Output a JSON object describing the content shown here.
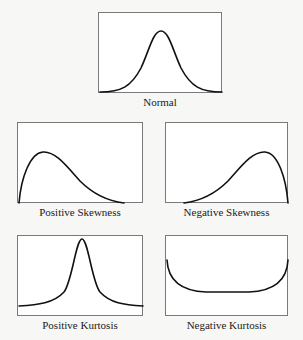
{
  "diagram": {
    "panels": [
      {
        "id": "normal",
        "label": "Normal",
        "shape": "symmetric bell curve"
      },
      {
        "id": "positive-skewness",
        "label": "Positive Skewness",
        "shape": "peak left, long right tail"
      },
      {
        "id": "negative-skewness",
        "label": "Negative Skewness",
        "shape": "peak right, long left tail"
      },
      {
        "id": "positive-kurtosis",
        "label": "Positive Kurtosis",
        "shape": "tall narrow peak, heavy tails"
      },
      {
        "id": "negative-kurtosis",
        "label": "Negative Kurtosis",
        "shape": "flat U-shaped curve"
      }
    ]
  },
  "colors": {
    "background": "#f7f7f5",
    "panel_fill": "#ffffff",
    "panel_border": "#7a7a7a",
    "curve": "#111111"
  }
}
